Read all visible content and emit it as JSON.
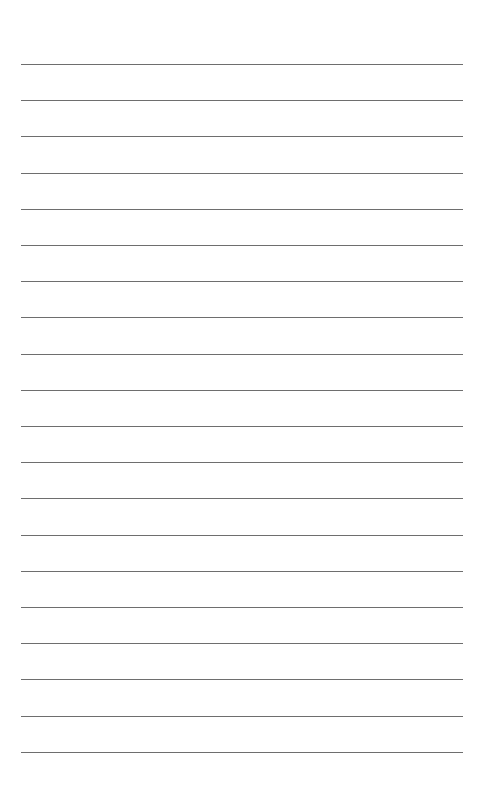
{
  "page": {
    "type": "lined-paper",
    "background_color": "#ffffff",
    "line_color": "#6e6e6e",
    "line_count": 20,
    "first_line_y": 64,
    "line_spacing": 36.2,
    "line_left": 21,
    "line_right": 463
  }
}
